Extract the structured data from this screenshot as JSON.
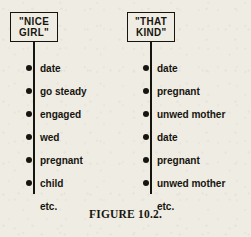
{
  "figure": {
    "caption": "FIGURE 10.2.",
    "ink_color": "#17150f",
    "paper_color": "#efece4"
  },
  "branches": [
    {
      "id": "nice-girl",
      "box": {
        "line1": "\"NICE",
        "line2": "GIRL\""
      },
      "nodes": [
        {
          "label": "date",
          "has_dot": true
        },
        {
          "label": "go steady",
          "has_dot": true
        },
        {
          "label": "engaged",
          "has_dot": true
        },
        {
          "label": "wed",
          "has_dot": true
        },
        {
          "label": "pregnant",
          "has_dot": true
        },
        {
          "label": "child",
          "has_dot": true
        },
        {
          "label": "etc.",
          "has_dot": false
        }
      ]
    },
    {
      "id": "that-kind",
      "box": {
        "line1": "\"THAT",
        "line2": "KIND\""
      },
      "nodes": [
        {
          "label": "date",
          "has_dot": true
        },
        {
          "label": "pregnant",
          "has_dot": true
        },
        {
          "label": "unwed mother",
          "has_dot": true
        },
        {
          "label": "date",
          "has_dot": true
        },
        {
          "label": "pregnant",
          "has_dot": true
        },
        {
          "label": "unwed mother",
          "has_dot": true
        },
        {
          "label": "etc.",
          "has_dot": false
        }
      ]
    }
  ]
}
